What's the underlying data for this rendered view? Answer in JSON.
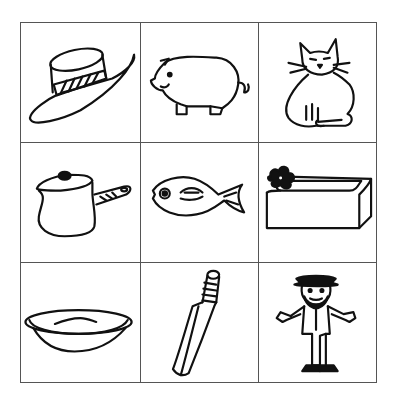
{
  "worksheet": {
    "layout": "3x3 picture grid",
    "cells": [
      {
        "row": 1,
        "col": 1,
        "picture": "hat"
      },
      {
        "row": 1,
        "col": 2,
        "picture": "pig"
      },
      {
        "row": 1,
        "col": 3,
        "picture": "cat"
      },
      {
        "row": 2,
        "col": 1,
        "picture": "pot"
      },
      {
        "row": 2,
        "col": 2,
        "picture": "fish"
      },
      {
        "row": 2,
        "col": 3,
        "picture": "bath"
      },
      {
        "row": 3,
        "col": 1,
        "picture": "dish"
      },
      {
        "row": 3,
        "col": 2,
        "picture": "bat"
      },
      {
        "row": 3,
        "col": 3,
        "picture": "man"
      }
    ],
    "colors": {
      "ink": "#111111",
      "grid_line": "#555555",
      "background": "#ffffff"
    }
  }
}
